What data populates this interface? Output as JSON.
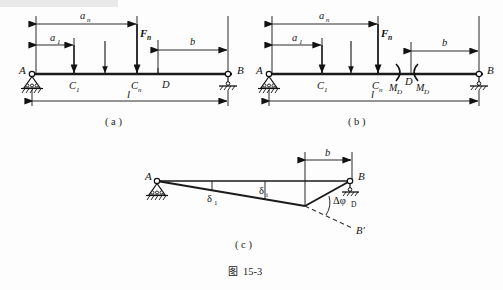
{
  "figure": {
    "caption_cn": "图",
    "caption_num": "15-3",
    "panels": [
      {
        "key": "a",
        "label": "（ a )"
      },
      {
        "key": "b",
        "label": "（ b )"
      },
      {
        "key": "c",
        "label": "（ c )"
      }
    ]
  },
  "panel_a": {
    "sublabel": "( a )",
    "supports": {
      "left": "A",
      "right": "B"
    },
    "nodes": {
      "c1": "C",
      "c1_sub": "1",
      "cn": "C",
      "cn_sub": "n",
      "d": "D"
    },
    "dimensions": {
      "a1": "a",
      "a1_sub": "1",
      "an": "a",
      "an_sub": "n",
      "b": "b",
      "l": "l"
    },
    "loads": {
      "fn": "F",
      "fn_sub": "n"
    }
  },
  "panel_b": {
    "sublabel": "( b )",
    "supports": {
      "left": "A",
      "right": "B"
    },
    "nodes": {
      "c1": "C",
      "c1_sub": "1",
      "cn": "C",
      "cn_sub": "n",
      "d": "D"
    },
    "dimensions": {
      "a1": "a",
      "a1_sub": "1",
      "an": "a",
      "an_sub": "n",
      "b": "b",
      "l": "l"
    },
    "loads": {
      "fn": "F",
      "fn_sub": "n"
    },
    "moments": {
      "left_moment": "M",
      "left_moment_sub": "D",
      "right_moment": "M",
      "right_moment_sub": "D"
    }
  },
  "panel_c": {
    "sublabel": "( c )",
    "supports": {
      "left": "A",
      "right": "B"
    },
    "deflected_point": "B",
    "deflected_point_prime": "B′",
    "dimensions": {
      "b": "b"
    },
    "deflections": {
      "delta1": "δ",
      "delta1_sub": "1",
      "deltai": "δ",
      "deltai_sub": "i"
    },
    "rotation": {
      "symbol": "Δφ",
      "sub": "D"
    }
  },
  "colors": {
    "ink": "#121212",
    "beam": "#1a1a1a",
    "background": "#fdfdfd",
    "dashed": "#333333"
  }
}
